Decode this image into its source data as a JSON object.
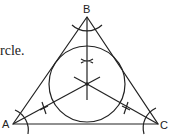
{
  "text_fragment": "rcle.",
  "labels": {
    "A": "A",
    "B": "B",
    "C": "C"
  },
  "diagram": {
    "vertices": {
      "A": [
        13,
        124
      ],
      "B": [
        87,
        17
      ],
      "C": [
        158,
        124
      ]
    },
    "incenter": [
      87,
      84
    ],
    "inradius": 38,
    "stroke_color": "#222222"
  }
}
